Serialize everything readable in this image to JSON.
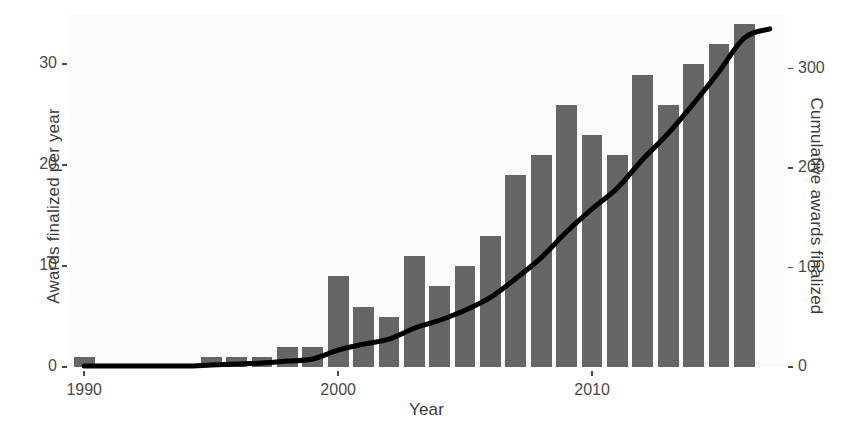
{
  "chart_data": {
    "type": "bar",
    "title": "",
    "subtitle": "",
    "xlabel": "Year",
    "ylabel": "Awards finalized per year",
    "y2label": "Cumulative awards finalized",
    "grid": false,
    "legend": null,
    "xlim": [
      1989.4,
      2017.6
    ],
    "ylim": [
      0,
      35
    ],
    "y2lim": [
      0,
      355
    ],
    "xticks": [
      1990,
      2000,
      2010
    ],
    "xticklabels": [
      "1990",
      "2000",
      "2010"
    ],
    "yticks": [
      0,
      10,
      20,
      30
    ],
    "yticklabels": [
      "0",
      "10",
      "20",
      "30"
    ],
    "y2ticks": [
      0,
      100,
      200,
      300
    ],
    "y2ticklabels": [
      "0",
      "100",
      "200",
      "300"
    ],
    "categories": [
      1990,
      1991,
      1992,
      1993,
      1994,
      1995,
      1996,
      1997,
      1998,
      1999,
      2000,
      2001,
      2002,
      2003,
      2004,
      2005,
      2006,
      2007,
      2008,
      2009,
      2010,
      2011,
      2012,
      2013,
      2014,
      2015,
      2016,
      2017
    ],
    "series": [
      {
        "name": "Awards finalized per year",
        "type": "bar",
        "axis": "left",
        "color": "#666666",
        "values": [
          1,
          0,
          0,
          0,
          0,
          1,
          1,
          1,
          2,
          2,
          9,
          6,
          5,
          11,
          8,
          10,
          13,
          19,
          21,
          26,
          23,
          21,
          29,
          26,
          30,
          32,
          34,
          0
        ]
      },
      {
        "name": "Cumulative awards finalized",
        "type": "line",
        "axis": "right",
        "color": "#000000",
        "values": [
          1,
          1,
          1,
          1,
          1,
          2,
          3,
          4,
          6,
          8,
          17,
          23,
          28,
          39,
          47,
          57,
          70,
          89,
          110,
          136,
          159,
          180,
          209,
          235,
          265,
          297,
          331,
          340
        ]
      }
    ]
  },
  "axes": {
    "x_title": "Year",
    "y_left_title": "Awards finalized per year",
    "y_right_title": "Cumulative awards finalized"
  },
  "style": {
    "panel_background": "#fbfbfb",
    "bar_color": "#666666",
    "line_color": "#000000",
    "tick_color": "#4a4a4a",
    "text_color": "#3b3b3b"
  }
}
